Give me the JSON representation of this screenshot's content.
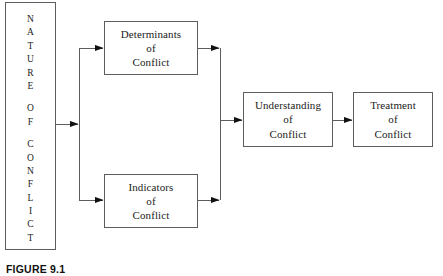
{
  "figure": {
    "caption": "FIGURE 9.1",
    "width": 443,
    "height": 276,
    "background_color": "#ffffff",
    "line_color": "#5d5d5d",
    "arrow_color": "#111111",
    "text_color": "#1b1b1b"
  },
  "nodes": {
    "nature": {
      "name": "NATURE OF CONFLICT",
      "orientation": "vertical-stacked-letters",
      "letters": [
        "N",
        "A",
        "T",
        "U",
        "R",
        "E",
        "",
        "O",
        "F",
        "",
        "C",
        "O",
        "N",
        "F",
        "L",
        "I",
        "C",
        "T"
      ]
    },
    "determinants": {
      "line1": "Determinants",
      "line2": "of",
      "line3": "Conflict"
    },
    "indicators": {
      "line1": "Indicators",
      "line2": "of",
      "line3": "Conflict"
    },
    "understanding": {
      "line1": "Understanding",
      "line2": "of",
      "line3": "Conflict"
    },
    "treatment": {
      "line1": "Treatment",
      "line2": "of",
      "line3": "Conflict"
    }
  },
  "connectors": [
    {
      "from": "nature",
      "to": "branch-split",
      "label": ""
    },
    {
      "from": "branch-split",
      "to": "determinants",
      "label": ""
    },
    {
      "from": "branch-split",
      "to": "indicators",
      "label": ""
    },
    {
      "from": "determinants",
      "to": "merge-join",
      "label": ""
    },
    {
      "from": "indicators",
      "to": "merge-join",
      "label": ""
    },
    {
      "from": "merge-join",
      "to": "understanding",
      "label": ""
    },
    {
      "from": "understanding",
      "to": "treatment",
      "label": ""
    }
  ]
}
